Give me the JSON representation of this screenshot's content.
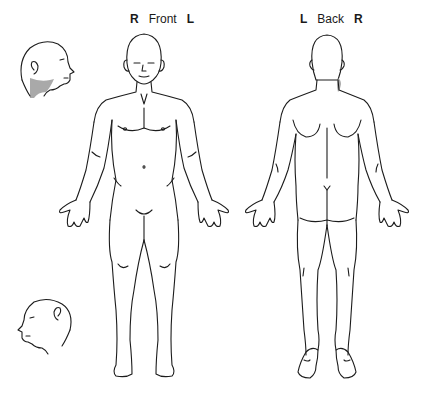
{
  "front": {
    "label_left": "R",
    "title": "Front",
    "label_right": "L"
  },
  "back": {
    "label_left": "L",
    "title": "Back",
    "label_right": "R"
  },
  "figures": [
    {
      "id": "head-right-profile",
      "view": "right side profile",
      "shaded_region": "right jaw / upper neck"
    },
    {
      "id": "body-front",
      "view": "front"
    },
    {
      "id": "body-back",
      "view": "back",
      "shaded_region": "right side of neck"
    },
    {
      "id": "head-left-profile",
      "view": "left side profile"
    }
  ],
  "colors": {
    "line": "#1c1c1c",
    "shade": "#9a9a9a",
    "background": "#ffffff"
  }
}
